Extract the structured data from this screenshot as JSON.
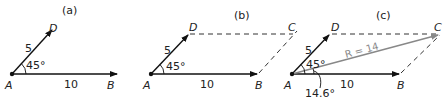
{
  "panels": [
    {
      "id": "a",
      "title": "(a)",
      "points": {
        "A": "A",
        "B": "B",
        "D": "D"
      },
      "labels": {
        "ad_magnitude": "5",
        "ab_magnitude": "10",
        "angle": "45°"
      }
    },
    {
      "id": "b",
      "title": "(b)",
      "points": {
        "A": "A",
        "B": "B",
        "C": "C",
        "D": "D"
      },
      "labels": {
        "ad_magnitude": "5",
        "ab_magnitude": "10",
        "angle": "45°"
      }
    },
    {
      "id": "c",
      "title": "(c)",
      "points": {
        "A": "A",
        "B": "B",
        "C": "C",
        "D": "D"
      },
      "labels": {
        "ad_magnitude": "5",
        "ab_magnitude": "10",
        "angle": "45°",
        "resultant": "R = 14",
        "resultant_angle": "14.6°"
      }
    }
  ],
  "colors": {
    "vector": "#111111",
    "dashed": "#333333",
    "resultant": "#888888"
  }
}
